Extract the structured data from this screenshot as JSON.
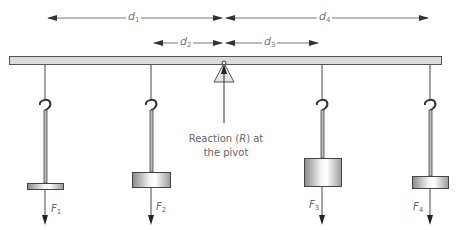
{
  "diagram": {
    "type": "lever-balance-moments",
    "distances": [
      {
        "id": "d1",
        "symbol": "d",
        "sub": "1"
      },
      {
        "id": "d2",
        "symbol": "d",
        "sub": "2"
      },
      {
        "id": "d3",
        "symbol": "d",
        "sub": "3"
      },
      {
        "id": "d4",
        "symbol": "d",
        "sub": "4"
      }
    ],
    "forces": [
      {
        "id": "F1",
        "symbol": "F",
        "sub": "1"
      },
      {
        "id": "F2",
        "symbol": "F",
        "sub": "2"
      },
      {
        "id": "F3",
        "symbol": "F",
        "sub": "3"
      },
      {
        "id": "F4",
        "symbol": "F",
        "sub": "4"
      }
    ],
    "pivot_label": {
      "line1_pre": "Reaction (",
      "line1_var": "R",
      "line1_post": ") at",
      "line2": "the pivot"
    },
    "colors": {
      "beam_fill": "#dcdcdc",
      "beam_stroke": "#555555",
      "line": "#444444",
      "arrow": "#333333",
      "label": "#666666"
    }
  }
}
